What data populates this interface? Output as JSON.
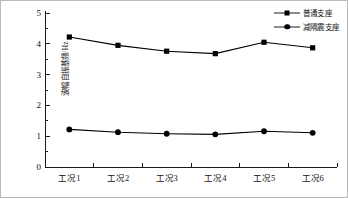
{
  "chart_data": {
    "type": "line",
    "title": "",
    "xlabel": "",
    "ylabel": "波幅自振基频/Hz",
    "categories": [
      "工况1",
      "工况2",
      "工况3",
      "工况4",
      "工况5",
      "工况6"
    ],
    "series": [
      {
        "name": "普通支座",
        "marker": "square",
        "color": "#000000",
        "values": [
          4.22,
          3.95,
          3.76,
          3.68,
          4.05,
          3.87
        ]
      },
      {
        "name": "减隔震支座",
        "marker": "circle",
        "color": "#000000",
        "values": [
          1.22,
          1.13,
          1.08,
          1.06,
          1.16,
          1.11
        ]
      }
    ],
    "ylim": [
      0,
      5
    ],
    "yticks": [
      0,
      1,
      2,
      3,
      4,
      5
    ],
    "yticklabels": [
      "0",
      "1",
      "2",
      "3",
      "4",
      "5"
    ],
    "yminorticks": [
      0.5,
      1.5,
      2.5,
      3.5,
      4.5
    ],
    "grid": false,
    "legend_position": "top-right"
  },
  "legend": {
    "entries": [
      {
        "label": "普通支座"
      },
      {
        "label": "减隔震支座"
      }
    ]
  }
}
